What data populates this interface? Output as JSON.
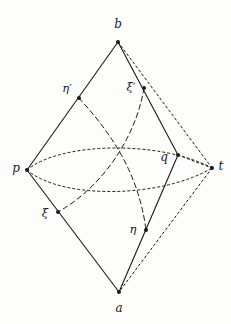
{
  "figure": {
    "type": "geometric-diagram",
    "width": 231,
    "height": 324,
    "background_color": "#fdfdfc",
    "ink_color": "#1a1a1a",
    "dot_radius": 2.0,
    "solid_stroke_width": 1.1,
    "dashed_stroke_width": 1.0,
    "dotted_stroke_width": 1.0,
    "dash_pattern": "5,3.5",
    "dot_pattern": "2.2,2.8",
    "vertices": [
      {
        "id": "b",
        "label": "b",
        "x": 118,
        "y": 42,
        "label_x": 118,
        "label_y": 24,
        "dot": true,
        "greek": false
      },
      {
        "id": "p",
        "label": "p",
        "x": 27,
        "y": 170,
        "label_x": 16,
        "label_y": 168,
        "dot": true,
        "greek": false
      },
      {
        "id": "t",
        "label": "t",
        "x": 212,
        "y": 168,
        "label_x": 221,
        "label_y": 166,
        "dot": true,
        "greek": false
      },
      {
        "id": "a",
        "label": "a",
        "x": 119,
        "y": 292,
        "label_x": 119,
        "label_y": 308,
        "dot": true,
        "greek": false
      },
      {
        "id": "etaprime",
        "label": "η′",
        "x": 79,
        "y": 98,
        "label_x": 67,
        "label_y": 89,
        "dot": true,
        "greek": true
      },
      {
        "id": "xiprime",
        "label": "ξ′",
        "x": 144,
        "y": 88,
        "label_x": 131,
        "label_y": 88,
        "dot": true,
        "greek": true
      },
      {
        "id": "q",
        "label": "q",
        "x": 178,
        "y": 155,
        "label_x": 164,
        "label_y": 157,
        "dot": true,
        "greek": false
      },
      {
        "id": "xi",
        "label": "ξ",
        "x": 58,
        "y": 212,
        "label_x": 45,
        "label_y": 214,
        "dot": true,
        "greek": true
      },
      {
        "id": "eta",
        "label": "η",
        "x": 146,
        "y": 230,
        "label_x": 133,
        "label_y": 230,
        "dot": true,
        "greek": true
      }
    ],
    "solid_edges": [
      {
        "name": "edge-b-etaprime-p",
        "from": "b",
        "to": "p",
        "via": "etaprime",
        "path": "M 118 42 L 27 170"
      },
      {
        "name": "edge-p-xi-a",
        "from": "p",
        "to": "a",
        "via": "xi",
        "path": "M 27 170 L 119 292"
      },
      {
        "name": "edge-b-xiprime-q",
        "from": "b",
        "to": "q",
        "via": "xiprime",
        "path": "M 118 42 L 178 155"
      },
      {
        "name": "edge-q-eta-a",
        "from": "q",
        "to": "a",
        "via": "eta",
        "path": "M 178 155 L 119 292"
      }
    ],
    "dotted_edges": [
      {
        "name": "edge-b-t",
        "from": "b",
        "to": "t",
        "path": "M 118 42 L 212 168"
      },
      {
        "name": "edge-t-a",
        "from": "t",
        "to": "a",
        "path": "M 212 168 L 119 292"
      },
      {
        "name": "edge-q-t",
        "from": "q",
        "to": "t",
        "path": "M 178 155 L 212 168"
      },
      {
        "name": "arc-p-t-upper",
        "from": "p",
        "to": "t",
        "path": "M 27 170 C 60 142 160 140 212 168"
      },
      {
        "name": "arc-p-t-lower",
        "from": "p",
        "to": "t",
        "path": "M 27 170 C 62 200 162 198 212 168"
      }
    ],
    "dashed_curves": [
      {
        "name": "curve-etaprime-eta",
        "from": "etaprime",
        "to": "eta",
        "path": "M 79 98 C 106 128 138 168 146 230"
      },
      {
        "name": "curve-xiprime-xi",
        "from": "xiprime",
        "to": "xi",
        "path": "M 144 88 C 136 136 104 186 58 212"
      }
    ]
  }
}
